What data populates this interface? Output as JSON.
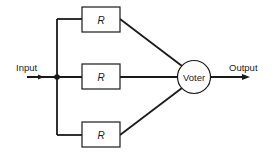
{
  "diagram": {
    "input_label": "Input",
    "output_label": "Output",
    "voter_label": "Voter",
    "modules": [
      {
        "label": "R"
      },
      {
        "label": "R"
      },
      {
        "label": "R"
      }
    ],
    "colors": {
      "stroke": "#1a1a1a",
      "background": "#ffffff"
    }
  }
}
